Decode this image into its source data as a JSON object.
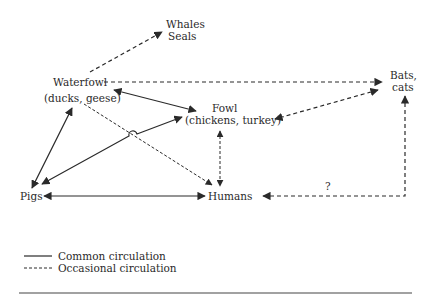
{
  "diagram": {
    "nodes": {
      "whales": {
        "line1": "Whales",
        "line2": "Seals"
      },
      "waterfowl": {
        "line1": "Waterfowl",
        "line2": "(ducks, geese)"
      },
      "bats": {
        "line1": "Bats,",
        "line2": "cats"
      },
      "fowl": {
        "line1": "Fowl",
        "line2": "(chickens, turkey)"
      },
      "pigs": {
        "label": "Pigs"
      },
      "humans": {
        "label": "Humans"
      }
    },
    "edges": [
      {
        "from": "Waterfowl",
        "to": "Whales/Seals",
        "type": "occasional",
        "direction": "one-way"
      },
      {
        "from": "Waterfowl",
        "to": "Bats, cats",
        "type": "occasional",
        "direction": "one-way"
      },
      {
        "from": "Waterfowl",
        "to": "Fowl",
        "type": "common",
        "direction": "two-way"
      },
      {
        "from": "Waterfowl",
        "to": "Pigs",
        "type": "common",
        "direction": "two-way"
      },
      {
        "from": "Waterfowl",
        "to": "Humans",
        "type": "occasional",
        "direction": "one-way"
      },
      {
        "from": "Pigs",
        "to": "Fowl",
        "type": "common",
        "direction": "two-way"
      },
      {
        "from": "Pigs",
        "to": "Humans",
        "type": "common",
        "direction": "two-way"
      },
      {
        "from": "Fowl",
        "to": "Humans",
        "type": "occasional",
        "direction": "two-way"
      },
      {
        "from": "Bats, cats",
        "to": "Fowl",
        "type": "occasional",
        "direction": "two-way"
      },
      {
        "from": "Bats, cats",
        "to": "Humans",
        "type": "occasional",
        "direction": "two-way",
        "label": "?"
      }
    ],
    "question_mark": "?"
  },
  "legend": {
    "common": "Common circulation",
    "occasional": "Occasional circulation"
  }
}
